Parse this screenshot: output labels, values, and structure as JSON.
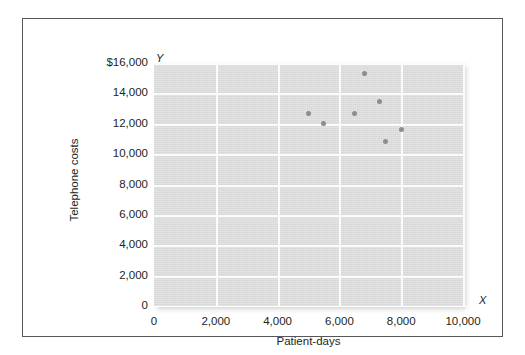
{
  "chart_data": {
    "type": "scatter",
    "title": "",
    "xlabel": "Patient-days",
    "ylabel": "Telephone costs",
    "xlim": [
      0,
      10000
    ],
    "ylim": [
      0,
      16000
    ],
    "xticks": [
      "0",
      "2,000",
      "4,000",
      "6,000",
      "8,000",
      "10,000"
    ],
    "xtick_values": [
      0,
      2000,
      4000,
      6000,
      8000,
      10000
    ],
    "yticks": [
      "0",
      "2,000",
      "4,000",
      "6,000",
      "8,000",
      "10,000",
      "12,000",
      "14,000",
      "$16,000"
    ],
    "ytick_values": [
      0,
      2000,
      4000,
      6000,
      8000,
      10000,
      12000,
      14000,
      16000
    ],
    "grid": true,
    "grid_color": "#fbfbfb",
    "plot_background": "#dcdcdc",
    "marker_color": "#8d8d8d",
    "legend": "none",
    "axis_marker_x": "X",
    "axis_marker_y": "Y",
    "points": [
      {
        "x": 5000,
        "y": 12700
      },
      {
        "x": 5500,
        "y": 12000
      },
      {
        "x": 6500,
        "y": 12650
      },
      {
        "x": 6800,
        "y": 15300
      },
      {
        "x": 7300,
        "y": 13450
      },
      {
        "x": 7500,
        "y": 10850
      },
      {
        "x": 8000,
        "y": 11600
      }
    ]
  }
}
